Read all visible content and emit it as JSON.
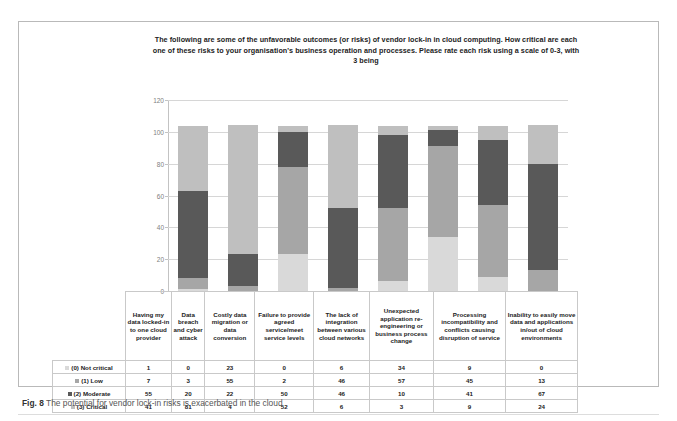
{
  "figure": {
    "caption_label": "Fig. 8",
    "caption_text": "The potential for vendor lock-in risks is exacerbated in the cloud"
  },
  "chart_data": {
    "type": "bar",
    "subtype": "stacked-column",
    "title": "The following are some of the unfavorable outcomes (or risks) of vendor lock-in in cloud computing. How critical are each one of these risks to your organisation's business operation and processes. Please rate each risk using a scale of 0-3, with 3 being",
    "xlabel": "",
    "ylabel": "",
    "ylim": [
      0,
      120
    ],
    "yticks": [
      0,
      20,
      40,
      60,
      80,
      100,
      120
    ],
    "grid": true,
    "legend_position": "table-row-labels",
    "categories": [
      "Having my data locked-in to one cloud provider",
      "Data breach and cyber attack",
      "Costly data migration or data conversion",
      "Failure to provide agreed service/meet service levels",
      "The lack of integration between various cloud networks",
      "Unexpected application re-engineering or business process change",
      "Processing incompatibility and conflicts causing disruption of service",
      "Inability to easily move data and applications in/out of cloud environments"
    ],
    "series": [
      {
        "name": "(0) Not critical",
        "color": "#d9d9d9",
        "values": [
          1,
          0,
          23,
          0,
          6,
          34,
          9,
          0
        ]
      },
      {
        "name": "(1) Low",
        "color": "#a6a6a6",
        "values": [
          7,
          3,
          55,
          2,
          46,
          57,
          45,
          13
        ]
      },
      {
        "name": "(2) Moderate",
        "color": "#595959",
        "values": [
          55,
          20,
          22,
          50,
          46,
          10,
          41,
          67
        ]
      },
      {
        "name": "(3) Critical",
        "color": "#bfbfbf",
        "values": [
          41,
          81,
          4,
          52,
          6,
          3,
          9,
          24
        ]
      }
    ]
  },
  "table": {
    "row_labels": [
      "(0) Not critical",
      "(1) Low",
      "(2) Moderate",
      "(3) Critical"
    ]
  }
}
